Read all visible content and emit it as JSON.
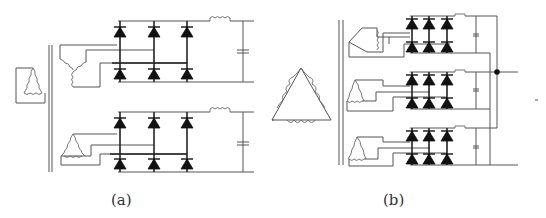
{
  "figure": {
    "panels": [
      {
        "id": "a",
        "caption": "(a)",
        "description": "Two-winding 12-pulse rectifier: delta primary, star and delta secondaries each feeding a 6-diode bridge with series inductor and shunt capacitor",
        "primary_winding": "delta",
        "secondary_windings": [
          "wye",
          "delta"
        ],
        "bridges": 2,
        "diodes_per_bridge": 6
      },
      {
        "id": "b",
        "caption": "(b)",
        "description": "Three-secondary 18-pulse rectifier: delta primary with three delta/extended secondaries, each feeding a 6-diode bridge with inductor and capacitor, outputs joined at a common node",
        "primary_winding": "delta",
        "secondary_windings": [
          "delta",
          "delta",
          "delta"
        ],
        "bridges": 3,
        "diodes_per_bridge": 6
      }
    ],
    "colors": {
      "wire": "#555555",
      "diode": "#111111",
      "background": "#ffffff"
    }
  }
}
